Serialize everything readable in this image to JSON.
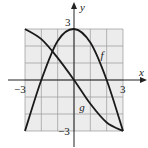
{
  "chart_data": {
    "type": "line",
    "title": "",
    "xlabel": "x",
    "ylabel": "y",
    "xlim": [
      -3,
      3
    ],
    "ylim": [
      -3,
      3
    ],
    "grid": true,
    "tick_labels": {
      "x_min": "−3",
      "x_max": "3",
      "y_max": "3",
      "y_min": "−3"
    },
    "series": [
      {
        "name": "f",
        "points": [
          [
            -3,
            -3
          ],
          [
            -2,
            0
          ],
          [
            -1,
            2.3
          ],
          [
            0,
            3
          ],
          [
            1,
            2.2
          ],
          [
            2,
            0
          ],
          [
            3,
            -3
          ]
        ]
      },
      {
        "name": "g",
        "points": [
          [
            -3,
            3
          ],
          [
            -2,
            2.4
          ],
          [
            -1,
            1.3
          ],
          [
            0,
            0
          ],
          [
            1,
            -1.4
          ],
          [
            2,
            -2.5
          ],
          [
            3,
            -3
          ]
        ]
      }
    ],
    "annotations": [
      {
        "text": "f",
        "x": 1.8,
        "y": 1.5
      },
      {
        "text": "g",
        "x": 0.5,
        "y": -1.6
      }
    ]
  },
  "colors": {
    "grid_fill": "#ececec",
    "grid_line": "#9a9a9a",
    "axis": "#222222",
    "curve": "#1a1a1a"
  }
}
